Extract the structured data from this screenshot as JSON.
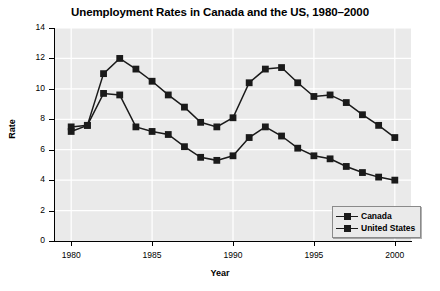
{
  "chart_data": {
    "type": "line",
    "title": "Unemployment Rates in Canada and the US, 1980–2000",
    "xlabel": "Year",
    "ylabel": "Rate",
    "xlim": [
      1979,
      2001
    ],
    "ylim": [
      0,
      14
    ],
    "grid": true,
    "legend_position": "bottom-right",
    "x": [
      1980,
      1981,
      1982,
      1983,
      1984,
      1985,
      1986,
      1987,
      1988,
      1989,
      1990,
      1991,
      1992,
      1993,
      1994,
      1995,
      1996,
      1997,
      1998,
      1999,
      2000
    ],
    "x_tick_labels": [
      "1980",
      "1985",
      "1990",
      "1995",
      "2000"
    ],
    "x_ticks": [
      1980,
      1985,
      1990,
      1995,
      2000
    ],
    "y_ticks": [
      0,
      2,
      4,
      6,
      8,
      10,
      12,
      14
    ],
    "y_tick_labels": [
      "0",
      "2",
      "4",
      "6",
      "8",
      "10",
      "12",
      "14"
    ],
    "series": [
      {
        "name": "Canada",
        "color": "#1a1a1a",
        "marker": "square",
        "values": [
          7.5,
          7.6,
          11.0,
          12.0,
          11.3,
          10.5,
          9.6,
          8.8,
          7.8,
          7.5,
          8.1,
          10.4,
          11.3,
          11.4,
          10.4,
          9.5,
          9.6,
          9.1,
          8.3,
          7.6,
          6.8
        ]
      },
      {
        "name": "United States",
        "color": "#1a1a1a",
        "marker": "square",
        "values": [
          7.2,
          7.6,
          9.7,
          9.6,
          7.5,
          7.2,
          7.0,
          6.2,
          5.5,
          5.3,
          5.6,
          6.8,
          7.5,
          6.9,
          6.1,
          5.6,
          5.4,
          4.9,
          4.5,
          4.2,
          4.0
        ]
      }
    ]
  },
  "style": {
    "panel_bg": "#eaeaea",
    "grid_color": "#ffffff",
    "axis_color": "#000000",
    "series_color": "#1a1a1a"
  }
}
